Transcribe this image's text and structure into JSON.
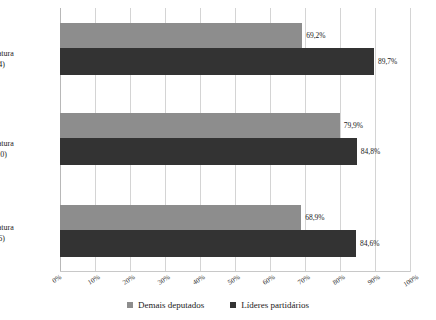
{
  "chart_data": {
    "type": "bar",
    "orientation": "horizontal",
    "title": "",
    "subtitle": "",
    "xlabel": "",
    "ylabel": "",
    "xlim": [
      0,
      100
    ],
    "xticks": [
      "0%",
      "10%",
      "20%",
      "30%",
      "40%",
      "50%",
      "60%",
      "70%",
      "80%",
      "90%",
      "100%"
    ],
    "xtick_values": [
      0,
      10,
      20,
      30,
      40,
      50,
      60,
      70,
      80,
      90,
      100
    ],
    "grid": true,
    "legend_position": "bottom",
    "categories": [
      "54ª legislatura (2011-4)",
      "53ª legislatura (2007-10)",
      "52ª legislatura (2003-6)"
    ],
    "category_lines": [
      {
        "line1": "54ª legislatura",
        "line2": "(2011-4)"
      },
      {
        "line1": "53ª legislatura",
        "line2": "(2007-10)"
      },
      {
        "line1": "52ª legislatura",
        "line2": "(2003-6)"
      }
    ],
    "series": [
      {
        "name": "Demais deputados",
        "color": "#8d8d8d",
        "values": [
          69.2,
          79.9,
          68.9
        ],
        "labels": [
          "69,2%",
          "79,9%",
          "68,9%"
        ]
      },
      {
        "name": "Líderes partidários",
        "color": "#333333",
        "values": [
          89.7,
          84.8,
          84.6
        ],
        "labels": [
          "89,7%",
          "84,8%",
          "84,6%"
        ]
      }
    ]
  },
  "legend": {
    "items": [
      {
        "label": "Demais deputados",
        "color": "#8d8d8d"
      },
      {
        "label": "Líderes partidários",
        "color": "#333333"
      }
    ]
  },
  "colors": {
    "series_demais": "#8d8d8d",
    "series_lideres": "#333333",
    "gridline": "#d4d4d4",
    "background": "#ffffff"
  }
}
